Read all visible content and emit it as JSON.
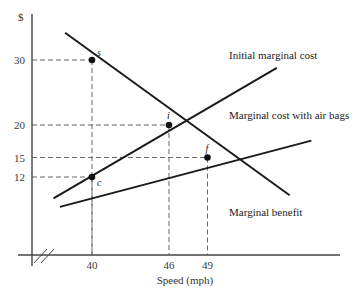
{
  "chart_data": {
    "type": "line",
    "title": "",
    "xlabel": "Speed (mph)",
    "ylabel": "$",
    "xlim": [
      33,
      58
    ],
    "ylim": [
      0,
      34
    ],
    "axis_break": "x",
    "grid": false,
    "x_ticks": [
      {
        "value": 40,
        "label": "40"
      },
      {
        "value": 46,
        "label": "46"
      },
      {
        "value": 49,
        "label": "49"
      }
    ],
    "y_ticks": [
      {
        "value": 30,
        "label": "30"
      },
      {
        "value": 20,
        "label": "20"
      },
      {
        "value": 15,
        "label": "15"
      },
      {
        "value": 12,
        "label": "12"
      }
    ],
    "series": [
      {
        "name": "Initial marginal cost",
        "x": [
          37.0,
          54.4
        ],
        "y": [
          8.7,
          28.8
        ],
        "color": "#1a1a1a"
      },
      {
        "name": "Marginal cost with air bags",
        "x": [
          37.5,
          57.1
        ],
        "y": [
          7.4,
          17.6
        ],
        "color": "#1a1a1a"
      },
      {
        "name": "Marginal benefit",
        "x": [
          37.9,
          55.4
        ],
        "y": [
          34.2,
          9.2
        ],
        "color": "#1a1a1a"
      }
    ],
    "points": [
      {
        "label": "s",
        "x": 40,
        "y": 30
      },
      {
        "label": "i",
        "x": 46,
        "y": 20
      },
      {
        "label": "f",
        "x": 49,
        "y": 15
      },
      {
        "label": "c",
        "x": 40,
        "y": 12
      }
    ],
    "guides": [
      {
        "x": 40,
        "y": 30
      },
      {
        "x": 46,
        "y": 20
      },
      {
        "x": 49,
        "y": 15
      },
      {
        "x": 40,
        "y": 12
      }
    ]
  }
}
